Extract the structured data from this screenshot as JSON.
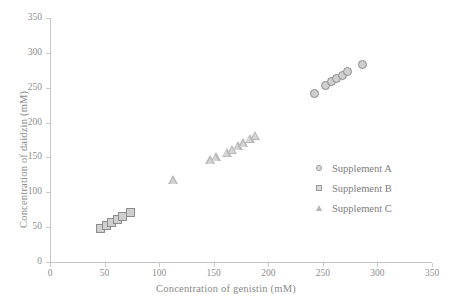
{
  "chart_data": {
    "type": "scatter",
    "title": "",
    "xlabel": "Concentration of genistin (mM)",
    "ylabel": "Concentration of daidzin (mM)",
    "xlim": [
      0,
      350
    ],
    "ylim": [
      0,
      350
    ],
    "xticks": [
      0,
      50,
      100,
      150,
      200,
      250,
      300,
      350
    ],
    "yticks": [
      0,
      50,
      100,
      150,
      200,
      250,
      300,
      350
    ],
    "grid": false,
    "legend_position": "center-right",
    "series": [
      {
        "name": "Supplement A",
        "marker": "circle",
        "color": "#cfcfcf",
        "points": [
          {
            "x": 243,
            "y": 241
          },
          {
            "x": 253,
            "y": 253
          },
          {
            "x": 258,
            "y": 258
          },
          {
            "x": 263,
            "y": 262
          },
          {
            "x": 268,
            "y": 267
          },
          {
            "x": 273,
            "y": 272
          },
          {
            "x": 287,
            "y": 283
          }
        ]
      },
      {
        "name": "Supplement B",
        "marker": "square",
        "color": "#cfcfcf",
        "points": [
          {
            "x": 47,
            "y": 48
          },
          {
            "x": 52,
            "y": 52
          },
          {
            "x": 57,
            "y": 56
          },
          {
            "x": 62,
            "y": 60
          },
          {
            "x": 67,
            "y": 64
          },
          {
            "x": 74,
            "y": 71
          }
        ]
      },
      {
        "name": "Supplement C",
        "marker": "triangle",
        "color": "#b9b9b9",
        "points": [
          {
            "x": 113,
            "y": 117
          },
          {
            "x": 147,
            "y": 146
          },
          {
            "x": 152,
            "y": 150
          },
          {
            "x": 162,
            "y": 157
          },
          {
            "x": 167,
            "y": 161
          },
          {
            "x": 172,
            "y": 166
          },
          {
            "x": 177,
            "y": 170
          },
          {
            "x": 183,
            "y": 177
          },
          {
            "x": 188,
            "y": 181
          }
        ]
      }
    ]
  },
  "legend": {
    "items": [
      {
        "label": "Supplement A",
        "marker": "circle"
      },
      {
        "label": "Supplement B",
        "marker": "square"
      },
      {
        "label": "Supplement C",
        "marker": "triangle"
      }
    ]
  }
}
